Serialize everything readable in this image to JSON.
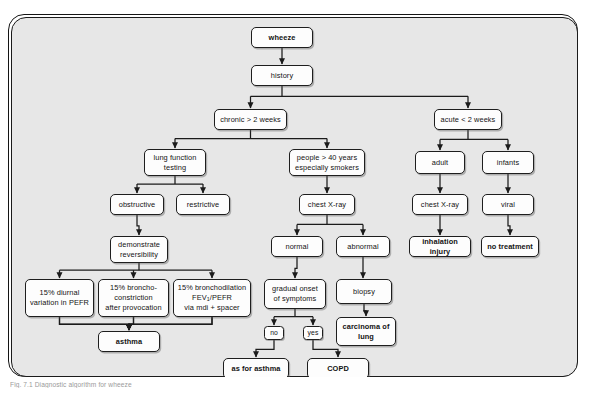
{
  "figure": {
    "caption": "Fig. 7.1  Diagnostic algorithm for wheeze",
    "frame_background": "#e7e7e7",
    "node_background": "#fdfdfd",
    "border_color": "#1e1e1e"
  },
  "chart_data": {
    "type": "diagram",
    "title": "wheeze",
    "nodes": [
      {
        "id": "wheeze",
        "label": "wheeze",
        "bold": true,
        "x": 240,
        "y": 10,
        "w": 62,
        "h": 21
      },
      {
        "id": "history",
        "label": "history",
        "bold": false,
        "x": 240,
        "y": 48,
        "w": 62,
        "h": 21
      },
      {
        "id": "chronic",
        "label": "chronic  > 2 weeks",
        "bold": false,
        "x": 203,
        "y": 92,
        "w": 73,
        "h": 21
      },
      {
        "id": "acute",
        "label": "acute < 2 weeks",
        "bold": false,
        "x": 423,
        "y": 92,
        "w": 68,
        "h": 21
      },
      {
        "id": "lung-function",
        "label": "lung function\ntesting",
        "bold": false,
        "x": 133,
        "y": 132,
        "w": 62,
        "h": 27
      },
      {
        "id": "people40",
        "label": "people > 40 years\nespecially smokers",
        "bold": false,
        "x": 278,
        "y": 132,
        "w": 76,
        "h": 27
      },
      {
        "id": "adult",
        "label": "adult",
        "bold": false,
        "x": 404,
        "y": 134,
        "w": 50,
        "h": 23
      },
      {
        "id": "infants",
        "label": "infants",
        "bold": false,
        "x": 471,
        "y": 134,
        "w": 52,
        "h": 23
      },
      {
        "id": "obstructive",
        "label": "obstructive",
        "bold": false,
        "x": 99,
        "y": 177,
        "w": 54,
        "h": 21
      },
      {
        "id": "restrictive",
        "label": "restrictive",
        "bold": false,
        "x": 165,
        "y": 177,
        "w": 54,
        "h": 21
      },
      {
        "id": "chest-xray-c",
        "label": "chest X-ray",
        "bold": false,
        "x": 288,
        "y": 177,
        "w": 56,
        "h": 21
      },
      {
        "id": "chest-xray-r",
        "label": "chest X-ray",
        "bold": false,
        "x": 401,
        "y": 177,
        "w": 56,
        "h": 21
      },
      {
        "id": "viral",
        "label": "viral",
        "bold": false,
        "x": 471,
        "y": 177,
        "w": 52,
        "h": 21
      },
      {
        "id": "demonstrate",
        "label": "demonstrate\nreversibility",
        "bold": false,
        "x": 99,
        "y": 219,
        "w": 58,
        "h": 27
      },
      {
        "id": "normal",
        "label": "normal",
        "bold": false,
        "x": 260,
        "y": 219,
        "w": 52,
        "h": 21
      },
      {
        "id": "abnormal",
        "label": "abnormal",
        "bold": false,
        "x": 325,
        "y": 219,
        "w": 54,
        "h": 21
      },
      {
        "id": "inhalation",
        "label": "inhalation injury",
        "bold": true,
        "x": 398,
        "y": 219,
        "w": 62,
        "h": 21
      },
      {
        "id": "no-treatment",
        "label": "no treatment",
        "bold": true,
        "x": 470,
        "y": 219,
        "w": 58,
        "h": 21
      },
      {
        "id": "diurnal",
        "label": "15% diurnal\nvariation in PEFR",
        "bold": false,
        "x": 14,
        "y": 262,
        "w": 69,
        "h": 38
      },
      {
        "id": "broncho",
        "label": "15% broncho-\nconstriction\nafter provocation",
        "bold": false,
        "x": 87,
        "y": 262,
        "w": 71,
        "h": 38
      },
      {
        "id": "bronchodil",
        "label": "15% bronchodilation\nFEV1/PEFR\nvia mdi + spacer",
        "bold": false,
        "x": 162,
        "y": 262,
        "w": 78,
        "h": 38,
        "subscript": "1"
      },
      {
        "id": "gradual",
        "label": "gradual onset\nof symptoms",
        "bold": false,
        "x": 253,
        "y": 262,
        "w": 62,
        "h": 30
      },
      {
        "id": "biopsy",
        "label": "biopsy",
        "bold": false,
        "x": 325,
        "y": 262,
        "w": 56,
        "h": 25
      },
      {
        "id": "no",
        "label": "no",
        "bold": false,
        "x": 253,
        "y": 309,
        "w": 20,
        "h": 14,
        "small": true
      },
      {
        "id": "yes",
        "label": "yes",
        "bold": false,
        "x": 292,
        "y": 309,
        "w": 20,
        "h": 14,
        "small": true
      },
      {
        "id": "carcinoma",
        "label": "carcinoma of\nlung",
        "bold": true,
        "x": 325,
        "y": 300,
        "w": 60,
        "h": 29
      },
      {
        "id": "asthma",
        "label": "asthma",
        "bold": true,
        "x": 87,
        "y": 314,
        "w": 62,
        "h": 21
      },
      {
        "id": "as-for-asthma",
        "label": "as for asthma",
        "bold": true,
        "x": 212,
        "y": 341,
        "w": 66,
        "h": 21
      },
      {
        "id": "copd",
        "label": "COPD",
        "bold": true,
        "x": 296,
        "y": 341,
        "w": 62,
        "h": 21
      }
    ],
    "edges": [
      {
        "from": "wheeze",
        "to": "history"
      },
      {
        "from": "history",
        "to": "chronic"
      },
      {
        "from": "history",
        "to": "acute"
      },
      {
        "from": "chronic",
        "to": "lung-function"
      },
      {
        "from": "chronic",
        "to": "people40"
      },
      {
        "from": "acute",
        "to": "adult"
      },
      {
        "from": "acute",
        "to": "infants"
      },
      {
        "from": "lung-function",
        "to": "obstructive"
      },
      {
        "from": "lung-function",
        "to": "restrictive"
      },
      {
        "from": "people40",
        "to": "chest-xray-c"
      },
      {
        "from": "adult",
        "to": "chest-xray-r"
      },
      {
        "from": "infants",
        "to": "viral"
      },
      {
        "from": "obstructive",
        "to": "demonstrate"
      },
      {
        "from": "chest-xray-c",
        "to": "normal"
      },
      {
        "from": "chest-xray-c",
        "to": "abnormal"
      },
      {
        "from": "chest-xray-r",
        "to": "inhalation"
      },
      {
        "from": "viral",
        "to": "no-treatment"
      },
      {
        "from": "demonstrate",
        "to": "diurnal"
      },
      {
        "from": "demonstrate",
        "to": "broncho"
      },
      {
        "from": "demonstrate",
        "to": "bronchodil"
      },
      {
        "from": "normal",
        "to": "gradual"
      },
      {
        "from": "abnormal",
        "to": "biopsy"
      },
      {
        "from": "gradual",
        "to": "no"
      },
      {
        "from": "gradual",
        "to": "yes"
      },
      {
        "from": "biopsy",
        "to": "carcinoma"
      },
      {
        "from": "diurnal",
        "to": "asthma"
      },
      {
        "from": "broncho",
        "to": "asthma"
      },
      {
        "from": "bronchodil",
        "to": "asthma"
      },
      {
        "from": "no",
        "to": "as-for-asthma"
      },
      {
        "from": "yes",
        "to": "copd"
      }
    ]
  }
}
